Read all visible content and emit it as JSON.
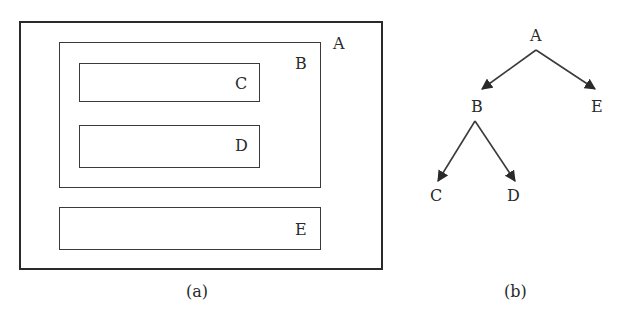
{
  "figure_a": {
    "caption": "(a)",
    "boxes": {
      "A": {
        "label": "A"
      },
      "B": {
        "label": "B"
      },
      "C": {
        "label": "C"
      },
      "D": {
        "label": "D"
      },
      "E": {
        "label": "E"
      }
    }
  },
  "figure_b": {
    "caption": "(b)",
    "nodes": {
      "A": {
        "label": "A"
      },
      "B": {
        "label": "B"
      },
      "C": {
        "label": "C"
      },
      "D": {
        "label": "D"
      },
      "E": {
        "label": "E"
      }
    },
    "edges": [
      {
        "from": "A",
        "to": "B"
      },
      {
        "from": "A",
        "to": "E"
      },
      {
        "from": "B",
        "to": "C"
      },
      {
        "from": "B",
        "to": "D"
      }
    ]
  },
  "colors": {
    "stroke": "#2a2a2a",
    "background": "#ffffff"
  }
}
